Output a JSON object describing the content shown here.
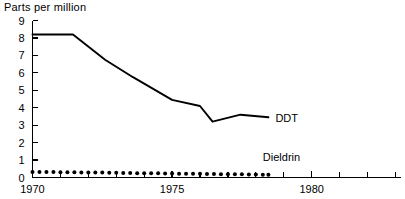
{
  "chart_data": {
    "type": "line",
    "title": "Parts per million",
    "xlabel": "",
    "ylabel": "Parts per million",
    "xlim": [
      1970,
      1983.2
    ],
    "ylim": [
      0,
      9
    ],
    "grid": false,
    "legend": "inline-right",
    "y_ticks": [
      "0",
      "1",
      "2",
      "3",
      "4",
      "5",
      "6",
      "7",
      "8",
      "9"
    ],
    "y_tick_values": [
      0,
      1,
      2,
      3,
      4,
      5,
      6,
      7,
      8,
      9
    ],
    "x_ticks": [
      "1970",
      "1975",
      "1980"
    ],
    "x_tick_values": [
      1970,
      1975,
      1980
    ],
    "x_minor_tick_values": [
      1971,
      1972,
      1973,
      1974,
      1976,
      1977,
      1978,
      1979,
      1981,
      1982,
      1983
    ],
    "series": [
      {
        "name": "DDT",
        "style": "solid",
        "label": "DDT",
        "x": [
          1970.0,
          1971.45,
          1972.6,
          1973.6,
          1975.0,
          1976.0,
          1976.45,
          1977.45,
          1978.45
        ],
        "values": [
          8.2,
          8.2,
          6.75,
          5.75,
          4.45,
          4.1,
          3.2,
          3.6,
          3.45
        ]
      },
      {
        "name": "Dieldrin",
        "style": "dotted",
        "label": "Dieldrin",
        "x": [
          1970.0,
          1970.25,
          1970.5,
          1970.75,
          1971.0,
          1971.25,
          1971.5,
          1971.75,
          1972.0,
          1972.25,
          1972.5,
          1972.75,
          1973.0,
          1973.25,
          1973.5,
          1973.75,
          1974.0,
          1974.25,
          1974.5,
          1974.75,
          1975.0,
          1975.25,
          1975.5,
          1975.75,
          1976.0,
          1976.25,
          1976.5,
          1976.75,
          1977.0,
          1977.25,
          1977.5,
          1977.75,
          1978.0,
          1978.25,
          1978.45
        ],
        "values": [
          0.32,
          0.32,
          0.31,
          0.31,
          0.3,
          0.3,
          0.3,
          0.29,
          0.29,
          0.28,
          0.28,
          0.27,
          0.27,
          0.26,
          0.26,
          0.25,
          0.25,
          0.24,
          0.24,
          0.23,
          0.23,
          0.22,
          0.22,
          0.21,
          0.21,
          0.2,
          0.2,
          0.19,
          0.19,
          0.18,
          0.18,
          0.17,
          0.17,
          0.16,
          0.16
        ]
      }
    ],
    "annotations": [
      {
        "text": "DDT",
        "x": 1978.7,
        "y": 3.4
      },
      {
        "text": "Dieldrin",
        "x": 1978.25,
        "y": 1.15
      }
    ],
    "colors": {
      "line": "#000000",
      "axis": "#000000",
      "background": "#ffffff"
    }
  }
}
